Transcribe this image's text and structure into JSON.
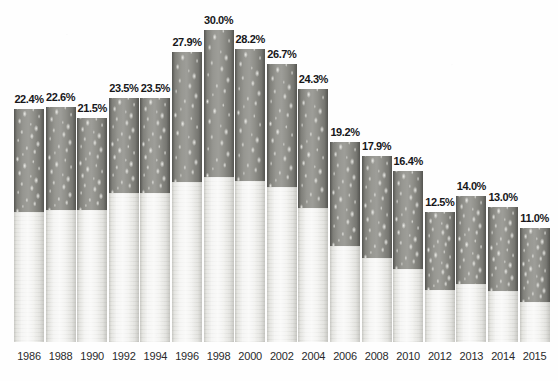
{
  "chart_data": {
    "type": "bar",
    "title": "",
    "subtitle": "",
    "xlabel": "",
    "ylabel": "",
    "ylim": [
      0,
      30
    ],
    "grid": false,
    "legend": null,
    "bar_style": "cigarette-pictorial",
    "value_suffix": "%",
    "categories": [
      "1986",
      "1988",
      "1990",
      "1992",
      "1994",
      "1996",
      "1998",
      "2000",
      "2002",
      "2004",
      "2006",
      "2008",
      "2010",
      "2012",
      "2013",
      "2014",
      "2015"
    ],
    "values": [
      22.4,
      22.6,
      21.5,
      23.5,
      23.5,
      27.9,
      30.0,
      28.2,
      26.7,
      24.3,
      19.2,
      17.9,
      16.4,
      12.5,
      14.0,
      13.0,
      11.0
    ],
    "data_labels": [
      "22.4%",
      "22.6%",
      "21.5%",
      "23.5%",
      "23.5%",
      "27.9%",
      "30.0%",
      "28.2%",
      "26.7%",
      "24.3%",
      "19.2%",
      "17.9%",
      "16.4%",
      "12.5%",
      "14.0%",
      "13.0%",
      "11.0%"
    ],
    "tobacco_fraction": [
      0.44,
      0.44,
      0.41,
      0.39,
      0.39,
      0.45,
      0.47,
      0.45,
      0.44,
      0.47,
      0.52,
      0.55,
      0.57,
      0.6,
      0.6,
      0.62,
      0.65
    ],
    "colors": {
      "background": "#fefefe",
      "tobacco": "#8b8b85",
      "filter": "#ebebe8",
      "label_text": "#17171a",
      "tick_text": "#2a2a2c"
    }
  }
}
